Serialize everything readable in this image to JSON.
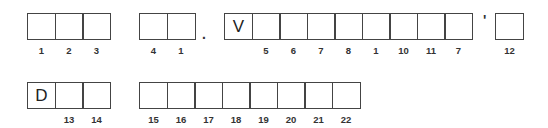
{
  "puzzle": {
    "row1": {
      "group1": [
        {
          "letter": "",
          "number": "1"
        },
        {
          "letter": "",
          "number": "2"
        },
        {
          "letter": "",
          "number": "3"
        }
      ],
      "group2": [
        {
          "letter": "",
          "number": "4"
        },
        {
          "letter": "",
          "number": "1"
        }
      ],
      "separator1": ".",
      "group3": [
        {
          "letter": "V",
          "number": ""
        },
        {
          "letter": "",
          "number": "5"
        },
        {
          "letter": "",
          "number": "6"
        },
        {
          "letter": "",
          "number": "7"
        },
        {
          "letter": "",
          "number": "8"
        },
        {
          "letter": "",
          "number": "1"
        },
        {
          "letter": "",
          "number": "10"
        },
        {
          "letter": "",
          "number": "11"
        },
        {
          "letter": "",
          "number": "7"
        }
      ],
      "separator2": "'",
      "group4": [
        {
          "letter": "",
          "number": "12"
        }
      ]
    },
    "row2": {
      "group1": [
        {
          "letter": "D",
          "number": ""
        },
        {
          "letter": "",
          "number": "13"
        },
        {
          "letter": "",
          "number": "14"
        }
      ],
      "group2": [
        {
          "letter": "",
          "number": "15"
        },
        {
          "letter": "",
          "number": "16"
        },
        {
          "letter": "",
          "number": "17"
        },
        {
          "letter": "",
          "number": "18"
        },
        {
          "letter": "",
          "number": "19"
        },
        {
          "letter": "",
          "number": "20"
        },
        {
          "letter": "",
          "number": "21"
        },
        {
          "letter": "",
          "number": "22"
        }
      ]
    }
  }
}
